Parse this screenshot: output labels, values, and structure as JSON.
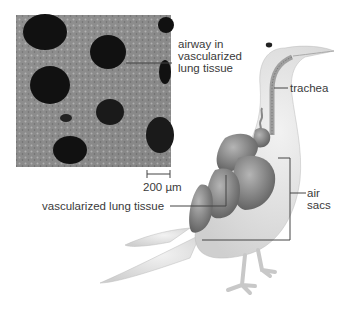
{
  "figure": {
    "type": "anatomical diagram"
  },
  "micrograph": {
    "description": "scanning electron micrograph of vascularized lung tissue",
    "scale_bar": "200 µm"
  },
  "labels": {
    "airway_line1": "airway in",
    "airway_line2": "vascularized",
    "airway_line3": "lung tissue",
    "trachea": "trachea",
    "lung": "vascularized lung tissue",
    "air_sacs_line1": "air",
    "air_sacs_line2": "sacs"
  },
  "colors": {
    "body": "#e4e4e4",
    "organs": "#8e8e8e",
    "organs_dark": "#6a6a6a",
    "leader_line": "#444444"
  }
}
